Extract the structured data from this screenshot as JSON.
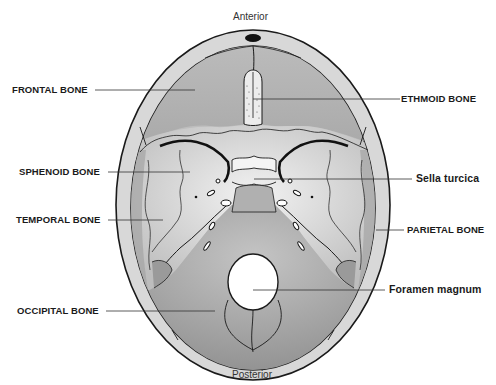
{
  "diagram": {
    "orientation": {
      "top": "Anterior",
      "bottom": "Posterior"
    },
    "labels_left": [
      {
        "id": "frontal",
        "text": "FRONTAL BONE"
      },
      {
        "id": "sphenoid",
        "text": "SPHENOID BONE"
      },
      {
        "id": "temporal",
        "text": "TEMPORAL BONE"
      },
      {
        "id": "occipital",
        "text": "OCCIPITAL BONE"
      }
    ],
    "labels_right": [
      {
        "id": "ethmoid",
        "text": "ETHMOID BONE"
      },
      {
        "id": "sella",
        "text": "Sella turcica"
      },
      {
        "id": "parietal",
        "text": "PARIETAL BONE"
      },
      {
        "id": "foramen",
        "text": "Foramen magnum"
      }
    ],
    "colors": {
      "outline": "#1a1a1a",
      "rim": "#d8d8d8",
      "frontal_fill": "#b4b4b4",
      "middle_fill": "#dcdcdc",
      "posterior_fill": "#a8a8a8",
      "ethmoid_fill": "#ececec",
      "leader_line": "#333333",
      "background": "#ffffff"
    }
  }
}
